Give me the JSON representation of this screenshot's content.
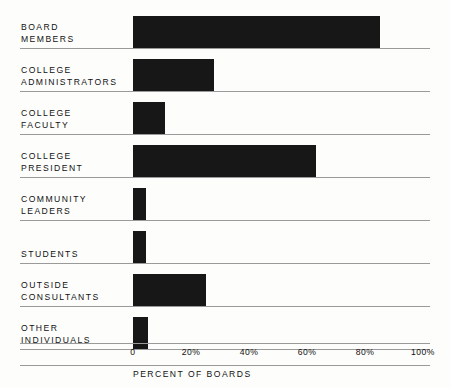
{
  "chart_data": {
    "type": "bar",
    "orientation": "horizontal",
    "title": "",
    "xlabel": "PERCENT OF BOARDS",
    "ylabel": "",
    "xlim": [
      0,
      100
    ],
    "grid": false,
    "legend": null,
    "xticks": [
      "0",
      "20%",
      "40%",
      "60%",
      "80%",
      "100%"
    ],
    "xtick_values": [
      0,
      20,
      40,
      60,
      80,
      100
    ],
    "categories": [
      "BOARD MEMBERS",
      "COLLEGE ADMINISTRATORS",
      "COLLEGE FACULTY",
      "COLLEGE PRESIDENT",
      "COMMUNITY LEADERS",
      "STUDENTS",
      "OUTSIDE CONSULTANTS",
      "OTHER INDIVIDUALS"
    ],
    "values": [
      85,
      28,
      11,
      63,
      4.5,
      4.5,
      25,
      5
    ],
    "bar_color": "#171717"
  },
  "axis": {
    "title": "PERCENT OF BOARDS",
    "ticks": [
      {
        "label": "0",
        "value": 0
      },
      {
        "label": "20%",
        "value": 20
      },
      {
        "label": "40%",
        "value": 40
      },
      {
        "label": "60%",
        "value": 60
      },
      {
        "label": "80%",
        "value": 80
      },
      {
        "label": "100%",
        "value": 100
      }
    ]
  },
  "rows": [
    {
      "line1": "BOARD",
      "line2": "MEMBERS",
      "value": 85
    },
    {
      "line1": "COLLEGE",
      "line2": "ADMINISTRATORS",
      "value": 28
    },
    {
      "line1": "COLLEGE",
      "line2": "FACULTY",
      "value": 11
    },
    {
      "line1": "COLLEGE",
      "line2": "PRESIDENT",
      "value": 63
    },
    {
      "line1": "COMMUNITY",
      "line2": "LEADERS",
      "value": 4.5
    },
    {
      "line1": "STUDENTS",
      "line2": "",
      "value": 4.5
    },
    {
      "line1": "OUTSIDE",
      "line2": "CONSULTANTS",
      "value": 25
    },
    {
      "line1": "OTHER",
      "line2": "INDIVIDUALS",
      "value": 5
    }
  ],
  "colors": {
    "bar": "#171717",
    "rule": "#9a9a9a",
    "text": "#111111",
    "background": "#fdfdfc"
  }
}
